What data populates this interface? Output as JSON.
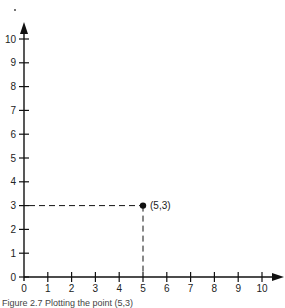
{
  "chart_data": {
    "type": "scatter",
    "title": "",
    "xlabel": "",
    "ylabel": "",
    "xlim": [
      0,
      10
    ],
    "ylim": [
      0,
      10
    ],
    "grid": false,
    "x_ticks": [
      0,
      1,
      2,
      3,
      4,
      5,
      6,
      7,
      8,
      9,
      10
    ],
    "y_ticks": [
      0,
      1,
      2,
      3,
      4,
      5,
      6,
      7,
      8,
      9,
      10
    ],
    "points": [
      {
        "x": 5,
        "y": 3,
        "label": "(5,3)"
      }
    ],
    "guides": "dashed lines from point to both axes"
  },
  "caption": "Figure 2.7  Plotting the point (5,3)"
}
